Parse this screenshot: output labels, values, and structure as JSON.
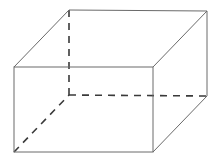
{
  "diagram": {
    "type": "cuboid-wireframe",
    "vertices": {
      "front_top_left": [
        14,
        67
      ],
      "front_top_right": [
        153,
        67
      ],
      "front_bottom_left": [
        14,
        152
      ],
      "front_bottom_right": [
        153,
        152
      ],
      "back_top_left": [
        69,
        10
      ],
      "back_top_right": [
        207,
        11
      ],
      "back_bottom_left": [
        69,
        95
      ],
      "back_bottom_right": [
        207,
        96
      ]
    },
    "visible_edges": [
      [
        "front_top_left",
        "front_top_right"
      ],
      [
        "front_top_right",
        "front_bottom_right"
      ],
      [
        "front_bottom_right",
        "front_bottom_left"
      ],
      [
        "front_bottom_left",
        "front_top_left"
      ],
      [
        "front_top_left",
        "back_top_left"
      ],
      [
        "back_top_left",
        "back_top_right"
      ],
      [
        "front_top_right",
        "back_top_right"
      ],
      [
        "back_top_right",
        "back_bottom_right"
      ],
      [
        "front_bottom_right",
        "back_bottom_right"
      ]
    ],
    "hidden_edges": [
      [
        "back_top_left",
        "back_bottom_left"
      ],
      [
        "back_bottom_left",
        "back_bottom_right"
      ],
      [
        "front_bottom_left",
        "back_bottom_left"
      ]
    ],
    "colors": {
      "solid_edge": "#6a6a6a",
      "hidden_edge": "#3a3a3a",
      "background": "#ffffff"
    }
  }
}
